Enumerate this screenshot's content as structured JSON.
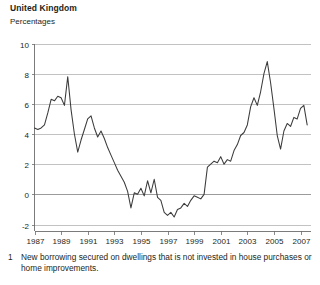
{
  "header": {
    "title": "United Kingdom",
    "subtitle": "Percentages"
  },
  "footnote": {
    "marker": "1",
    "text": "New borrowing secured on dwellings that is not invested in house purchases or home improvements."
  },
  "chart_data": {
    "type": "line",
    "title": "United Kingdom",
    "subtitle": "Percentages",
    "xlabel": "",
    "ylabel": "",
    "ylim": [
      -2,
      10
    ],
    "xlim": [
      1987,
      2007.75
    ],
    "yticks": [
      -2,
      0,
      2,
      4,
      6,
      8,
      10
    ],
    "ytick_labels": [
      "-2",
      "0",
      "2",
      "4",
      "6",
      "8",
      "10"
    ],
    "xticks": [
      1987,
      1989,
      1991,
      1993,
      1995,
      1997,
      1999,
      2001,
      2003,
      2005,
      2007
    ],
    "xtick_labels": [
      "1987",
      "1989",
      "1991",
      "1993",
      "1995",
      "1997",
      "1999",
      "2001",
      "2003",
      "2005",
      "2007"
    ],
    "grid": true,
    "legend": false,
    "line_color": "#3b3b3b",
    "grid_color": "#b3b3b3",
    "axis_color": "#6d6d6d",
    "series": [
      {
        "name": "Equity withdrawal as a percentage of post-tax income",
        "x": [
          1987.0,
          1987.25,
          1987.5,
          1987.75,
          1988.0,
          1988.25,
          1988.5,
          1988.75,
          1989.0,
          1989.25,
          1989.5,
          1989.75,
          1990.0,
          1990.25,
          1990.5,
          1990.75,
          1991.0,
          1991.25,
          1991.5,
          1991.75,
          1992.0,
          1992.25,
          1992.5,
          1992.75,
          1993.0,
          1993.25,
          1993.5,
          1993.75,
          1994.0,
          1994.25,
          1994.5,
          1994.75,
          1995.0,
          1995.25,
          1995.5,
          1995.75,
          1996.0,
          1996.25,
          1996.5,
          1996.75,
          1997.0,
          1997.25,
          1997.5,
          1997.75,
          1998.0,
          1998.25,
          1998.5,
          1998.75,
          1999.0,
          1999.25,
          1999.5,
          1999.75,
          2000.0,
          2000.25,
          2000.5,
          2000.75,
          2001.0,
          2001.25,
          2001.5,
          2001.75,
          2002.0,
          2002.25,
          2002.5,
          2002.75,
          2003.0,
          2003.25,
          2003.5,
          2003.75,
          2004.0,
          2004.25,
          2004.5,
          2004.75,
          2005.0,
          2005.25,
          2005.5,
          2005.75,
          2006.0,
          2006.25,
          2006.5,
          2006.75,
          2007.0,
          2007.25,
          2007.5
        ],
        "values": [
          4.4,
          4.3,
          4.4,
          4.6,
          5.4,
          6.3,
          6.2,
          6.5,
          6.4,
          5.9,
          7.8,
          5.6,
          4.0,
          2.8,
          3.6,
          4.3,
          5.0,
          5.2,
          4.4,
          3.8,
          4.2,
          3.7,
          3.1,
          2.6,
          2.1,
          1.6,
          1.2,
          0.8,
          0.2,
          -0.9,
          0.1,
          0.0,
          0.4,
          -0.1,
          0.9,
          0.1,
          1.0,
          -0.2,
          -0.4,
          -1.2,
          -1.4,
          -1.2,
          -1.5,
          -1.0,
          -0.9,
          -0.6,
          -0.8,
          -0.4,
          -0.1,
          -0.2,
          -0.3,
          0.0,
          1.8,
          2.0,
          2.2,
          2.1,
          2.5,
          2.0,
          2.3,
          2.2,
          2.9,
          3.3,
          3.9,
          4.1,
          4.6,
          5.8,
          6.4,
          5.9,
          6.8,
          8.0,
          8.8,
          7.4,
          5.7,
          3.9,
          3.0,
          4.2,
          4.7,
          4.5,
          5.1,
          5.0,
          5.7,
          5.9,
          4.6
        ]
      }
    ]
  }
}
